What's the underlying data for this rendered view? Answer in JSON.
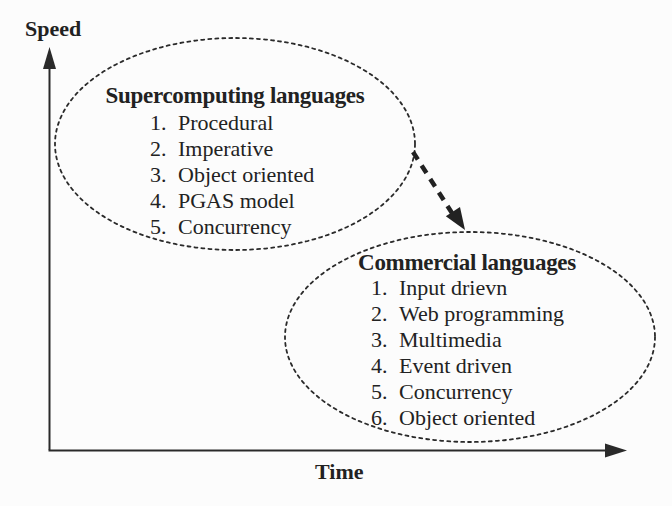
{
  "figure": {
    "background": "#fcfcfc",
    "ink": "#222222"
  },
  "axes": {
    "y_label": "Speed",
    "x_label": "Time"
  },
  "connector": {
    "style": "thick dashed arrow",
    "from": "Supercomputing languages",
    "to": "Commercial languages"
  },
  "groups": [
    {
      "title": "Supercomputing languages",
      "items": [
        {
          "num": "1.",
          "label": "Procedural"
        },
        {
          "num": "2.",
          "label": "Imperative"
        },
        {
          "num": "3.",
          "label": "Object oriented"
        },
        {
          "num": "4.",
          "label": "PGAS model"
        },
        {
          "num": "5.",
          "label": "Concurrency"
        }
      ]
    },
    {
      "title": "Commercial languages",
      "items": [
        {
          "num": "1.",
          "label": "Input drievn"
        },
        {
          "num": "2.",
          "label": "Web programming"
        },
        {
          "num": "3.",
          "label": "Multimedia"
        },
        {
          "num": "4.",
          "label": "Event driven"
        },
        {
          "num": "5.",
          "label": "Concurrency"
        },
        {
          "num": "6.",
          "label": "Object oriented"
        }
      ]
    }
  ]
}
